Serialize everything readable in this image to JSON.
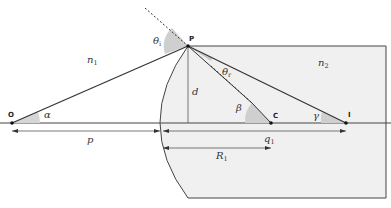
{
  "diagram": {
    "media": {
      "left": "n",
      "left_sub": "1",
      "right": "n",
      "right_sub": "2"
    },
    "points": {
      "object": "O",
      "surface_point": "P",
      "center": "C",
      "image": "I"
    },
    "angles": {
      "incidence": "θ",
      "incidence_sub": "i",
      "refraction": "θ",
      "refraction_sub": "r",
      "alpha": "α",
      "beta": "β",
      "gamma": "γ"
    },
    "lengths": {
      "height": "d",
      "object_distance": "p",
      "image_distance": "q",
      "image_distance_sub": "1",
      "radius": "R",
      "radius_sub": "1"
    },
    "colors": {
      "block_fill": "#f0f0f0",
      "angle_fill": "#cfcfcf",
      "line": "#333333"
    }
  }
}
